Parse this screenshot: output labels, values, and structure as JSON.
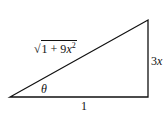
{
  "diagram": {
    "type": "right-triangle",
    "labels": {
      "hypotenuse": {
        "radicand_lead": "1 + 9",
        "var": "x",
        "exp": "2",
        "text": "√(1 + 9x²)"
      },
      "opposite": {
        "coef": "3",
        "var": "x"
      },
      "adjacent": "1",
      "angle": "θ"
    },
    "stroke_color": "#111111"
  }
}
